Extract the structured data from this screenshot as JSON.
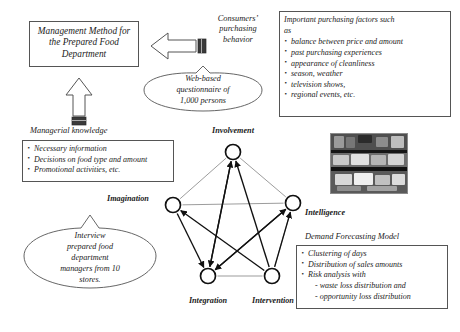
{
  "figure": {
    "management_box": {
      "text": "Management Method for the Prepared Food Department",
      "line1": "Management Method for",
      "line2": "the Prepared Food",
      "line3": "Department"
    },
    "consumer_label": {
      "line1": "Consumers’",
      "line2": "purchasing",
      "line3": "behavior"
    },
    "questionnaire_callout": {
      "line1": "Web-based",
      "line2": "questionnaire of",
      "line3": "1,000 persons"
    },
    "factors_box": {
      "intro_line1": "Important purchasing factors such",
      "intro_line2": "as",
      "items": [
        "balance between price and amount",
        "past purchasing experiences",
        "appearance of cleanliness",
        "season, weather",
        "television shows,",
        "regional events, etc."
      ]
    },
    "managerial_knowledge": {
      "title": "Managerial knowledge",
      "items": [
        "Necessary information",
        "Decisions on food type and amount",
        "Promotional activities, etc."
      ]
    },
    "interview_callout": {
      "line1": "Interview",
      "line2": "prepared food",
      "line3": "department",
      "line4": "managers from 10",
      "line5": "stores."
    },
    "demand_model": {
      "title": "Demand Forecasting Model",
      "items": [
        "Clustering of days",
        "Distribution of sales amounts",
        "Risk analysis with"
      ],
      "sub_items": [
        "- waste loss distribution and",
        "- opportunity loss distribution"
      ]
    },
    "photo": {
      "caption": "prepared-food display case photograph"
    },
    "network": {
      "nodes": [
        {
          "id": "involvement",
          "label": "Involvement",
          "x": 233,
          "y": 152
        },
        {
          "id": "imagination",
          "label": "Imagination",
          "x": 173,
          "y": 205
        },
        {
          "id": "intelligence",
          "label": "Intelligence",
          "x": 293,
          "y": 203
        },
        {
          "id": "integration",
          "label": "Integration",
          "x": 208,
          "y": 276
        },
        {
          "id": "intervention",
          "label": "Intervention",
          "x": 272,
          "y": 276
        }
      ],
      "edges": [
        {
          "from": "imagination",
          "to": "involvement",
          "arrow": "none"
        },
        {
          "from": "involvement",
          "to": "intelligence",
          "arrow": "none"
        },
        {
          "from": "imagination",
          "to": "intelligence",
          "arrow": "none"
        },
        {
          "from": "integration",
          "to": "intervention",
          "arrow": "none"
        },
        {
          "from": "imagination",
          "to": "integration",
          "arrow": "end"
        },
        {
          "from": "intelligence",
          "to": "intervention",
          "arrow": "none"
        },
        {
          "from": "integration",
          "to": "involvement",
          "arrow": "end"
        },
        {
          "from": "intervention",
          "to": "involvement",
          "arrow": "end"
        },
        {
          "from": "intervention",
          "to": "imagination",
          "arrow": "end"
        },
        {
          "from": "integration",
          "to": "intelligence",
          "arrow": "end"
        },
        {
          "from": "involvement",
          "to": "integration",
          "arrow": "end"
        },
        {
          "from": "intelligence",
          "to": "integration",
          "arrow": "end"
        },
        {
          "from": "intervention",
          "to": "intelligence",
          "arrow": "end"
        }
      ]
    },
    "block_arrows": [
      {
        "id": "consumer-to-management",
        "direction": "left"
      },
      {
        "id": "knowledge-to-management",
        "direction": "up"
      }
    ],
    "colors": {
      "ink": "#1a1a1a",
      "border": "#555555",
      "thin_line": "#777777",
      "paper": "#ffffff"
    }
  }
}
